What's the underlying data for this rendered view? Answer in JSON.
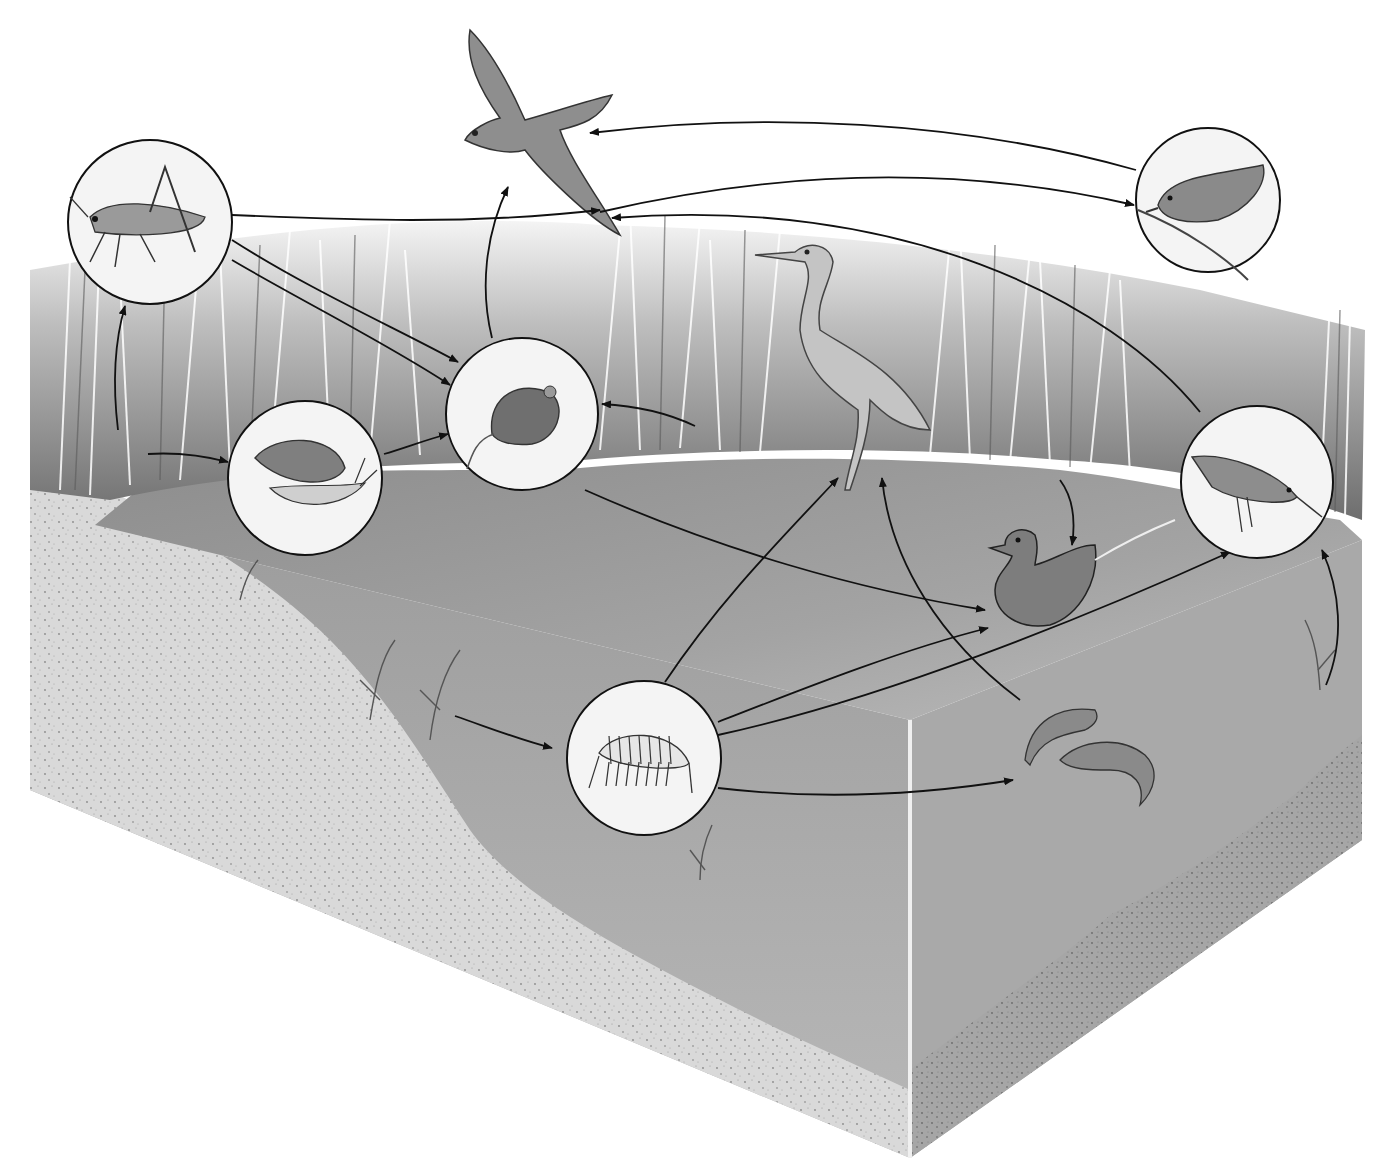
{
  "diagram": {
    "type": "food-web",
    "ecosystem": "marsh / pond cross-section",
    "colors": {
      "background": "#ffffff",
      "reeds_dark": "#6f6f6f",
      "reeds_light": "#e6e6e6",
      "water_surface": "#9a9a9a",
      "water_body": "#b4b4b4",
      "water_side": "#a8a8a8",
      "sediment": "#c8c8c8",
      "sediment_dark": "#8a8a8a",
      "bank": "#e2e2e2",
      "arrow": "#111111",
      "circle_fill": "#f4f4f4",
      "circle_stroke": "#111111"
    },
    "nodes": [
      {
        "id": "grasshopper",
        "label": "Grasshopper",
        "shape": "circle",
        "cx": 150,
        "cy": 222,
        "r": 82
      },
      {
        "id": "snail",
        "label": "Snail",
        "shape": "circle",
        "cx": 305,
        "cy": 478,
        "r": 77
      },
      {
        "id": "mouse",
        "label": "Mouse",
        "shape": "circle",
        "cx": 522,
        "cy": 414,
        "r": 76
      },
      {
        "id": "amphipod",
        "label": "Amphipod (scud)",
        "shape": "circle",
        "cx": 644,
        "cy": 758,
        "r": 77
      },
      {
        "id": "songbird",
        "label": "Songbird",
        "shape": "circle",
        "cx": 1208,
        "cy": 200,
        "r": 72
      },
      {
        "id": "sandpiper",
        "label": "Shorebird",
        "shape": "circle",
        "cx": 1257,
        "cy": 482,
        "r": 76
      },
      {
        "id": "hawk",
        "label": "Hawk",
        "shape": "free",
        "x": 530,
        "y": 110
      },
      {
        "id": "heron",
        "label": "Heron",
        "shape": "free",
        "x": 850,
        "y": 380
      },
      {
        "id": "duck",
        "label": "Duck",
        "shape": "free",
        "x": 1040,
        "y": 580
      },
      {
        "id": "fish",
        "label": "Fish",
        "shape": "free",
        "x": 1090,
        "y": 740
      },
      {
        "id": "reeds",
        "label": "Marsh reeds",
        "shape": "free",
        "x": 120,
        "y": 420
      },
      {
        "id": "underwater_plants",
        "label": "Submerged plants",
        "shape": "free",
        "x": 430,
        "y": 700
      }
    ],
    "edges": [
      {
        "from": "reeds",
        "to": "grasshopper",
        "d": "M118 430 C112 380 115 340 125 306"
      },
      {
        "from": "reeds",
        "to": "snail",
        "d": "M148 454 C180 452 205 456 228 462"
      },
      {
        "from": "grasshopper",
        "to": "mouse",
        "d": "M232 240 C310 290 400 330 458 362"
      },
      {
        "from": "grasshopper",
        "to": "mouse",
        "d": "M232 260 C300 300 390 345 450 385"
      },
      {
        "from": "snail",
        "to": "mouse",
        "d": "M384 454 C405 448 425 440 448 434"
      },
      {
        "from": "reeds",
        "to": "mouse",
        "d": "M695 426 C670 414 640 406 602 404"
      },
      {
        "from": "grasshopper",
        "to": "hawk",
        "d": "M232 215 C350 220 470 225 600 210"
      },
      {
        "from": "mouse",
        "to": "hawk",
        "d": "M492 338 C480 290 485 235 508 187"
      },
      {
        "from": "songbird",
        "to": "hawk",
        "d": "M1136 170 C960 120 760 112 590 133"
      },
      {
        "from": "grasshopper",
        "to": "songbird",
        "d": "M600 212 C780 170 960 165 1134 205"
      },
      {
        "from": "sandpiper",
        "to": "hawk",
        "d": "M1200 412 C1110 300 900 195 612 218"
      },
      {
        "from": "mouse",
        "to": "duck",
        "d": "M585 490 C720 550 860 590 985 610"
      },
      {
        "from": "amphipod",
        "to": "heron",
        "d": "M665 682 C720 600 780 540 838 478"
      },
      {
        "from": "fish",
        "to": "heron",
        "d": "M1020 700 C940 640 890 560 882 478"
      },
      {
        "from": "reeds",
        "to": "duck",
        "d": "M1060 480 C1075 500 1075 525 1072 545"
      },
      {
        "from": "amphipod",
        "to": "duck",
        "d": "M718 722 C800 690 900 650 988 628"
      },
      {
        "from": "amphipod",
        "to": "sandpiper",
        "d": "M718 735 C880 700 1080 620 1230 552"
      },
      {
        "from": "amphipod",
        "to": "fish",
        "d": "M718 788 C820 800 920 795 1013 780"
      },
      {
        "from": "underwater_plants",
        "to": "amphipod",
        "d": "M455 716 C490 728 520 740 552 748"
      },
      {
        "from": "underwater_plants",
        "to": "sandpiper",
        "d": "M1326 685 C1345 640 1340 590 1322 550"
      }
    ]
  }
}
